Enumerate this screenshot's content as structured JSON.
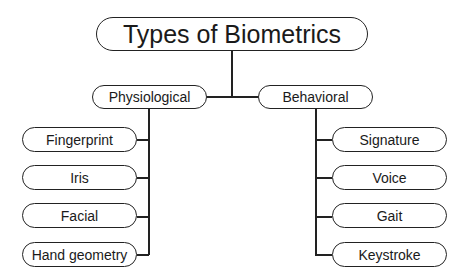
{
  "diagram": {
    "title": "Types of Biometrics",
    "categories": [
      {
        "label": "Physiological",
        "items": [
          "Fingerprint",
          "Iris",
          "Facial",
          "Hand geometry"
        ]
      },
      {
        "label": "Behavioral",
        "items": [
          "Signature",
          "Voice",
          "Gait",
          "Keystroke"
        ]
      }
    ]
  }
}
